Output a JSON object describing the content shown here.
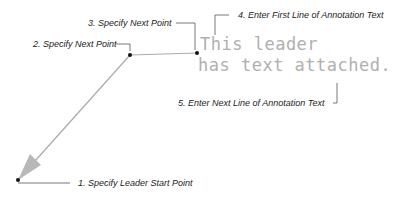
{
  "diagram": {
    "annotation_text": {
      "line1": "This leader",
      "line2": "has text attached."
    },
    "steps": [
      {
        "label": "1. Specify Leader Start Point"
      },
      {
        "label": "2. Specify Next Point"
      },
      {
        "label": "3. Specify Next Point"
      },
      {
        "label": "4. Enter First Line of Annotation Text"
      },
      {
        "label": "5. Enter Next Line of Annotation Text"
      }
    ],
    "colors": {
      "leader": "#aaaaaa",
      "arrowhead": "#b8b8b8",
      "points": "#111111",
      "annotation": "#b0b0b0",
      "callout_text": "#222222"
    }
  }
}
